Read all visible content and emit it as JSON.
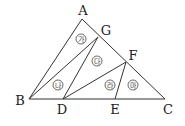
{
  "diagram": {
    "type": "geometry-triangle-partition",
    "points": {
      "A": {
        "label": "A",
        "x": 82,
        "y": 19,
        "lx": 83,
        "ly": 15
      },
      "G": {
        "label": "G",
        "x": 98,
        "y": 37,
        "lx": 106,
        "ly": 35
      },
      "F": {
        "label": "F",
        "x": 126,
        "y": 62,
        "lx": 133,
        "ly": 60
      },
      "B": {
        "label": "B",
        "x": 29,
        "y": 99,
        "lx": 20,
        "ly": 105
      },
      "D": {
        "label": "D",
        "x": 63,
        "y": 99,
        "lx": 62,
        "ly": 114
      },
      "E": {
        "label": "E",
        "x": 115,
        "y": 99,
        "lx": 115,
        "ly": 114
      },
      "C": {
        "label": "C",
        "x": 165,
        "y": 99,
        "lx": 168,
        "ly": 114
      }
    },
    "segments": [
      [
        "A",
        "B"
      ],
      [
        "A",
        "C"
      ],
      [
        "B",
        "C"
      ],
      [
        "B",
        "G"
      ],
      [
        "D",
        "G"
      ],
      [
        "D",
        "F"
      ],
      [
        "E",
        "F"
      ]
    ],
    "regions": [
      {
        "id": "ga",
        "label": "가",
        "x": 81,
        "y": 39
      },
      {
        "id": "na",
        "label": "나",
        "x": 58,
        "y": 85
      },
      {
        "id": "da",
        "label": "다",
        "x": 97,
        "y": 61
      },
      {
        "id": "ra",
        "label": "라",
        "x": 110,
        "y": 85
      },
      {
        "id": "ma",
        "label": "마",
        "x": 133,
        "y": 85
      }
    ]
  }
}
